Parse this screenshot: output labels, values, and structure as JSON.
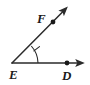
{
  "figure": {
    "type": "geometry-angle-diagram",
    "background_color": "#ffffff",
    "stroke_color": "#2b2b2b",
    "label_color": "#1a1a1a",
    "vertex": {
      "name": "E",
      "label": "E",
      "x": 12,
      "y": 63,
      "label_x": 9,
      "label_y": 79
    },
    "points": [
      {
        "name": "D",
        "label": "D",
        "x": 67,
        "y": 63,
        "label_x": 62,
        "label_y": 80,
        "dot_radius": 2.4,
        "on_ray": "ED"
      },
      {
        "name": "F",
        "label": "F",
        "x": 53,
        "y": 22,
        "label_x": 37,
        "label_y": 23,
        "dot_radius": 2.4,
        "on_ray": "EF"
      }
    ],
    "rays": [
      {
        "name": "ray-ED",
        "from": "E",
        "through": "D",
        "tip_x": 84,
        "tip_y": 63,
        "arrow": true
      },
      {
        "name": "ray-EF",
        "from": "E",
        "through": "F",
        "tip_x": 68,
        "tip_y": 6,
        "arrow": true
      }
    ],
    "angle_mark": {
      "name": "angle-arc-E",
      "arcs": 1,
      "ticks": 1,
      "radius": 26,
      "start_angle_deg": 0,
      "end_angle_deg": 42,
      "tick_angle_deg": 21
    }
  }
}
